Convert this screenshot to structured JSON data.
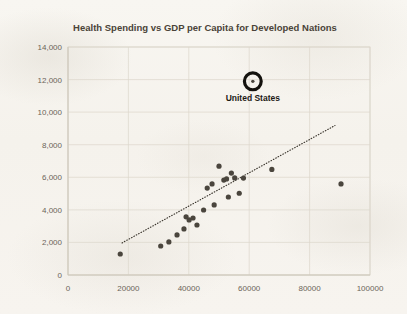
{
  "chart_data": {
    "type": "scatter",
    "title": "Health Spending vs GDP per Capita for Developed Nations",
    "xlabel": "",
    "ylabel": "",
    "xlim": [
      0,
      100000
    ],
    "ylim": [
      0,
      14000
    ],
    "grid": true,
    "legend": false,
    "x_ticks": [
      "0",
      "20000",
      "40000",
      "60000",
      "80000",
      "100000"
    ],
    "x_tick_values": [
      0,
      20000,
      40000,
      60000,
      80000,
      100000
    ],
    "y_ticks": [
      "0",
      "2,000",
      "4,000",
      "6,000",
      "8,000",
      "10,000",
      "12,000",
      "14,000"
    ],
    "y_tick_values": [
      0,
      2000,
      4000,
      6000,
      8000,
      10000,
      12000,
      14000
    ],
    "series": [
      {
        "name": "Developed Nations",
        "marker": "circle",
        "color": "#4a453d",
        "points": [
          {
            "x": 17300,
            "y": 1290
          },
          {
            "x": 30700,
            "y": 1780
          },
          {
            "x": 33400,
            "y": 2030
          },
          {
            "x": 36100,
            "y": 2460
          },
          {
            "x": 38400,
            "y": 2830
          },
          {
            "x": 39100,
            "y": 3570
          },
          {
            "x": 40100,
            "y": 3380
          },
          {
            "x": 41400,
            "y": 3500
          },
          {
            "x": 42700,
            "y": 3070
          },
          {
            "x": 44900,
            "y": 3990
          },
          {
            "x": 46100,
            "y": 5340
          },
          {
            "x": 47700,
            "y": 5590
          },
          {
            "x": 48400,
            "y": 4300
          },
          {
            "x": 50000,
            "y": 6680
          },
          {
            "x": 51600,
            "y": 5830
          },
          {
            "x": 52500,
            "y": 5900
          },
          {
            "x": 53100,
            "y": 4790
          },
          {
            "x": 54100,
            "y": 6260
          },
          {
            "x": 55200,
            "y": 5960
          },
          {
            "x": 56700,
            "y": 5020
          },
          {
            "x": 58100,
            "y": 5950
          },
          {
            "x": 67500,
            "y": 6480
          },
          {
            "x": 90400,
            "y": 5590
          }
        ]
      }
    ],
    "highlighted_point": {
      "label": "United States",
      "x": 61200,
      "y": 11890,
      "ring_color": "#14120e"
    },
    "trendline": {
      "style": "dotted",
      "color": "#3a352d",
      "x_start": 17900,
      "y_start": 1970,
      "x_end": 88400,
      "y_end": 9180
    }
  }
}
